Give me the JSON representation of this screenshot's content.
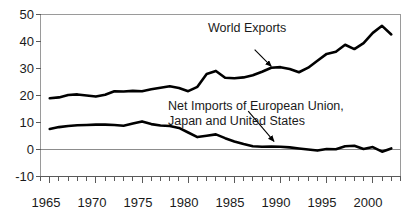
{
  "chart_data": {
    "type": "line",
    "title": "",
    "xlabel": "",
    "ylabel": "",
    "xlim": [
      1964,
      2003
    ],
    "ylim": [
      -10,
      50
    ],
    "yticks": [
      -10,
      0,
      10,
      20,
      30,
      40,
      50
    ],
    "ytick_labels": [
      "-10",
      "0",
      "10",
      "20",
      "30",
      "40",
      "50"
    ],
    "xticks": [
      1965,
      1970,
      1975,
      1980,
      1985,
      1990,
      1995,
      2000
    ],
    "xtick_labels": [
      "1965",
      "1970",
      "1975",
      "1980",
      "1985",
      "1990",
      "1995",
      "2000"
    ],
    "minor_xticks_every": 1,
    "grid": false,
    "legend": "inline-annotations",
    "zero_line": true,
    "x": [
      1965,
      1966,
      1967,
      1968,
      1969,
      1970,
      1971,
      1972,
      1973,
      1974,
      1975,
      1976,
      1977,
      1978,
      1979,
      1980,
      1981,
      1982,
      1983,
      1984,
      1985,
      1986,
      1987,
      1988,
      1989,
      1990,
      1991,
      1992,
      1993,
      1994,
      1995,
      1996,
      1997,
      1998,
      1999,
      2000,
      2001,
      2002
    ],
    "series": [
      {
        "name": "World Exports",
        "values": [
          19.0,
          19.3,
          20.2,
          20.4,
          20.0,
          19.6,
          20.3,
          21.6,
          21.5,
          21.7,
          21.6,
          22.3,
          22.9,
          23.4,
          22.8,
          21.6,
          23.2,
          28.0,
          29.1,
          26.6,
          26.4,
          26.7,
          27.5,
          28.8,
          30.3,
          30.5,
          29.8,
          28.6,
          30.3,
          32.9,
          35.4,
          36.2,
          38.8,
          37.2,
          39.4,
          43.2,
          45.8,
          42.6
        ]
      },
      {
        "name": "Net Imports of European Union, Japan and United States",
        "values": [
          7.6,
          8.3,
          8.7,
          9.0,
          9.1,
          9.2,
          9.2,
          9.1,
          8.8,
          9.6,
          10.4,
          9.4,
          8.9,
          8.7,
          8.0,
          6.3,
          4.6,
          5.1,
          5.6,
          4.2,
          3.0,
          2.0,
          1.2,
          1.0,
          1.1,
          1.0,
          0.8,
          0.4,
          0.0,
          -0.4,
          0.2,
          0.1,
          1.2,
          1.4,
          0.2,
          0.9,
          -0.8,
          0.4
        ]
      }
    ],
    "annotations": [
      {
        "id": "world-exports-label",
        "lines": [
          "World Exports"
        ],
        "arrow_from": [
          1987.2,
          37.0
        ],
        "arrow_to": [
          1989.0,
          30.8
        ]
      },
      {
        "id": "net-imports-label",
        "lines": [
          "Net Imports of European Union,",
          "Japan and United States"
        ],
        "arrow_from": [
          1986.5,
          14.2
        ],
        "arrow_to": [
          1989.3,
          3.0
        ]
      }
    ],
    "colors": {
      "line": "#000000",
      "axis": "#808080",
      "zero_line": "#808080",
      "text": "#1a1a1a",
      "background": "#ffffff"
    }
  },
  "axes": {
    "y_labels": [
      "50",
      "40",
      "30",
      "20",
      "10",
      "0",
      "-10"
    ],
    "x_labels": [
      "1965",
      "1970",
      "1975",
      "1980",
      "1985",
      "1990",
      "1995",
      "2000"
    ]
  },
  "annotations": {
    "world_exports": "World Exports",
    "net_imports_line1": "Net Imports of European Union,",
    "net_imports_line2": "Japan and United States"
  }
}
